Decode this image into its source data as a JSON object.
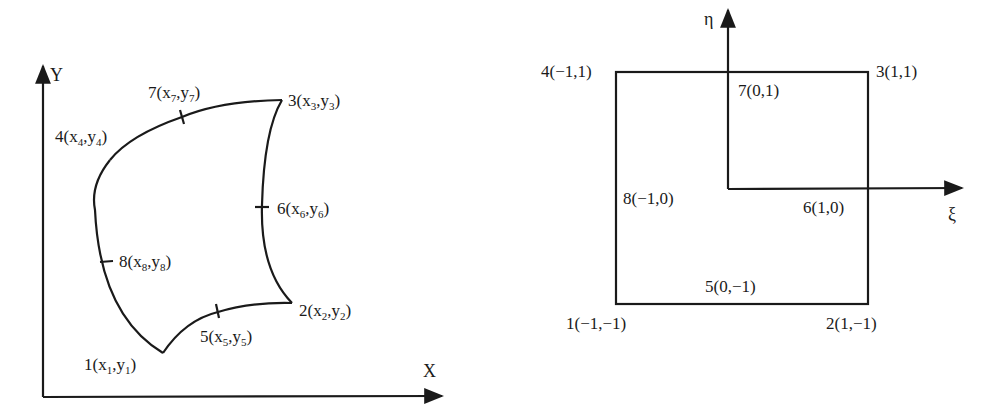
{
  "physical_element": {
    "axes": {
      "x_label": "X",
      "y_label": "Y"
    },
    "nodes": [
      {
        "id": "1",
        "label_prefix": "1(",
        "x_sym": "x",
        "x_sub": "1",
        "y_sym": "y",
        "y_sub": "1"
      },
      {
        "id": "2",
        "label_prefix": "2(",
        "x_sym": "x",
        "x_sub": "2",
        "y_sym": "y",
        "y_sub": "2"
      },
      {
        "id": "3",
        "label_prefix": "3(",
        "x_sym": "x",
        "x_sub": "3",
        "y_sym": "y",
        "y_sub": "3"
      },
      {
        "id": "4",
        "label_prefix": "4(",
        "x_sym": "x",
        "x_sub": "4",
        "y_sym": "y",
        "y_sub": "4"
      },
      {
        "id": "5",
        "label_prefix": "5(",
        "x_sym": "x",
        "x_sub": "5",
        "y_sym": "y",
        "y_sub": "5"
      },
      {
        "id": "6",
        "label_prefix": "6(",
        "x_sym": "x",
        "x_sub": "6",
        "y_sym": "y",
        "y_sub": "6"
      },
      {
        "id": "7",
        "label_prefix": "7(",
        "x_sym": "x",
        "x_sub": "7",
        "y_sym": "y",
        "y_sub": "7"
      },
      {
        "id": "8",
        "label_prefix": "8(",
        "x_sym": "x",
        "x_sub": "8",
        "y_sym": "y",
        "y_sub": "8"
      }
    ],
    "comma": ",",
    "close": ")"
  },
  "reference_element": {
    "axes": {
      "xi_label": "ξ",
      "eta_label": "η"
    },
    "nodes": [
      {
        "id": "1",
        "label": "1(−1,−1)"
      },
      {
        "id": "2",
        "label": "2(1,−1)"
      },
      {
        "id": "3",
        "label": "3(1,1)"
      },
      {
        "id": "4",
        "label": "4(−1,1)"
      },
      {
        "id": "5",
        "label": "5(0,−1)"
      },
      {
        "id": "6",
        "label": "6(1,0)"
      },
      {
        "id": "7",
        "label": "7(0,1)"
      },
      {
        "id": "8",
        "label": "8(−1,0)"
      }
    ]
  },
  "colors": {
    "line": "#1a1a1a",
    "background": "#ffffff"
  }
}
